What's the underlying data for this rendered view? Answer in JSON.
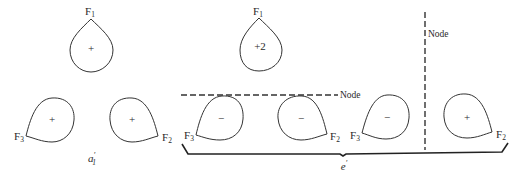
{
  "diagram": {
    "labels": {
      "f1": "F",
      "f2": "F",
      "f3": "F",
      "sub1": "1",
      "sub2": "2",
      "sub3": "3"
    },
    "groups": {
      "a1": {
        "symbol": "a",
        "prime": "′",
        "subscript": "1"
      },
      "e": {
        "symbol": "e",
        "prime": "′"
      }
    },
    "a1_lobes": {
      "top_sign": "+",
      "left_sign": "+",
      "right_sign": "+"
    },
    "e_combination_1": {
      "top_sign": "+2",
      "left_sign": "−",
      "right_sign": "−"
    },
    "e_combination_2": {
      "left_sign": "−",
      "right_sign": "+"
    },
    "nodes": {
      "horizontal_label": "Node",
      "vertical_label": "Node"
    },
    "colors": {
      "line": "#333333",
      "background": "#ffffff"
    }
  }
}
